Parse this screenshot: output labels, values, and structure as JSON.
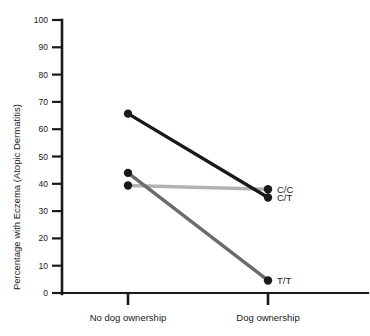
{
  "chart_data": {
    "type": "line",
    "title": "",
    "subtitle": "",
    "xlabel": "",
    "ylabel": "Percentage with Eczema (Atopic Dermatitis)",
    "categories": [
      "No dog ownership",
      "Dog ownership"
    ],
    "ylim": [
      0,
      100
    ],
    "yticks": [
      0,
      10,
      20,
      30,
      40,
      50,
      60,
      70,
      80,
      90,
      100
    ],
    "ytick_labels": [
      "0",
      "10",
      "20",
      "30",
      "40",
      "50",
      "60",
      "70",
      "80",
      "90",
      "100"
    ],
    "grid": false,
    "legend_position": "right-inline-endpoint-labels",
    "series": [
      {
        "name": "C/C",
        "label": "C/C",
        "values": [
          39.4,
          38.0
        ],
        "color": "#b3b3b3",
        "marker_color": "#1a1a1a"
      },
      {
        "name": "C/T",
        "label": "C/T",
        "values": [
          65.7,
          35.0
        ],
        "color": "#1a1a1a",
        "marker_color": "#1a1a1a"
      },
      {
        "name": "T/T",
        "label": "T/T",
        "values": [
          44.0,
          4.6
        ],
        "color": "#6b6b6b",
        "marker_color": "#1a1a1a"
      }
    ],
    "annotations": [
      {
        "text": "C/C",
        "value": 38.0,
        "category": "Dog ownership"
      },
      {
        "text": "C/T",
        "value": 35.0,
        "category": "Dog ownership"
      },
      {
        "text": "T/T",
        "value": 4.6,
        "category": "Dog ownership"
      }
    ],
    "axis": {
      "axis_color": "#1a1a1a",
      "y_axis_visible": true,
      "x_axis_visible": true
    }
  }
}
